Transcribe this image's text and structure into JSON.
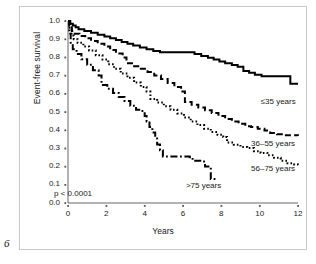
{
  "figure": {
    "number": "6"
  },
  "chart_data": {
    "type": "line",
    "title": "",
    "xlabel": "Years",
    "ylabel": "Event-free survival",
    "xlim": [
      0,
      12
    ],
    "ylim": [
      0.0,
      1.0
    ],
    "grid": false,
    "legend_position": "inline-right",
    "annotations": [
      {
        "name": "p-value",
        "text": "p < 0.0001",
        "x": 0.5,
        "y": 0.09
      }
    ],
    "xticks": [
      0,
      2,
      4,
      6,
      8,
      10,
      12
    ],
    "xtick_labels": [
      "0",
      "2",
      "4",
      "6",
      "8",
      "10",
      "12"
    ],
    "yticks": [
      0.0,
      0.1,
      0.2,
      0.3,
      0.4,
      0.5,
      0.6,
      0.7,
      0.8,
      0.9,
      1.0
    ],
    "ytick_labels": [
      "0.0",
      "0.1",
      "0.2",
      "0.3",
      "0.4",
      "0.5",
      "0.6",
      "0.7",
      "0.8",
      "0.9",
      "1.0"
    ],
    "series": [
      {
        "name": "≤35 years",
        "label": "≤35 years",
        "style": "solid",
        "color": "#000000",
        "label_x": 10.05,
        "label_y": 0.555,
        "points": [
          [
            0.0,
            1.0
          ],
          [
            0.12,
            0.985
          ],
          [
            0.25,
            0.975
          ],
          [
            0.4,
            0.965
          ],
          [
            0.55,
            0.955
          ],
          [
            0.85,
            0.945
          ],
          [
            1.2,
            0.935
          ],
          [
            1.55,
            0.925
          ],
          [
            1.9,
            0.915
          ],
          [
            2.2,
            0.905
          ],
          [
            2.5,
            0.895
          ],
          [
            2.8,
            0.885
          ],
          [
            3.1,
            0.875
          ],
          [
            3.4,
            0.865
          ],
          [
            3.75,
            0.855
          ],
          [
            4.1,
            0.845
          ],
          [
            4.45,
            0.835
          ],
          [
            4.8,
            0.828
          ],
          [
            6.3,
            0.828
          ],
          [
            6.6,
            0.818
          ],
          [
            6.95,
            0.808
          ],
          [
            7.3,
            0.798
          ],
          [
            7.6,
            0.788
          ],
          [
            7.9,
            0.778
          ],
          [
            8.2,
            0.768
          ],
          [
            8.55,
            0.758
          ],
          [
            8.85,
            0.748
          ],
          [
            9.15,
            0.725
          ],
          [
            9.45,
            0.715
          ],
          [
            9.75,
            0.705
          ],
          [
            10.1,
            0.697
          ],
          [
            11.45,
            0.697
          ],
          [
            11.6,
            0.655
          ],
          [
            12.0,
            0.655
          ]
        ]
      },
      {
        "name": "36–55 years",
        "label": "36–55 years",
        "style": "dashed",
        "color": "#000000",
        "label_x": 9.55,
        "label_y": 0.325,
        "points": [
          [
            0.0,
            1.0
          ],
          [
            0.1,
            0.965
          ],
          [
            0.2,
            0.945
          ],
          [
            0.35,
            0.93
          ],
          [
            0.6,
            0.918
          ],
          [
            0.9,
            0.905
          ],
          [
            1.2,
            0.89
          ],
          [
            1.55,
            0.875
          ],
          [
            1.9,
            0.86
          ],
          [
            2.2,
            0.84
          ],
          [
            2.5,
            0.822
          ],
          [
            2.85,
            0.8
          ],
          [
            3.05,
            0.768
          ],
          [
            3.45,
            0.752
          ],
          [
            3.8,
            0.738
          ],
          [
            4.15,
            0.72
          ],
          [
            4.5,
            0.7
          ],
          [
            4.85,
            0.682
          ],
          [
            5.2,
            0.66
          ],
          [
            5.55,
            0.638
          ],
          [
            5.9,
            0.612
          ],
          [
            6.1,
            0.555
          ],
          [
            6.45,
            0.54
          ],
          [
            6.8,
            0.525
          ],
          [
            7.15,
            0.51
          ],
          [
            7.5,
            0.495
          ],
          [
            7.85,
            0.478
          ],
          [
            8.2,
            0.462
          ],
          [
            8.55,
            0.448
          ],
          [
            8.9,
            0.435
          ],
          [
            9.25,
            0.422
          ],
          [
            9.55,
            0.418
          ],
          [
            9.9,
            0.408
          ],
          [
            10.25,
            0.398
          ],
          [
            10.55,
            0.385
          ],
          [
            10.9,
            0.378
          ],
          [
            11.3,
            0.372
          ],
          [
            12.0,
            0.37
          ]
        ]
      },
      {
        "name": "56–75 years",
        "label": "56–75 years",
        "style": "dotted",
        "color": "#000000",
        "label_x": 9.55,
        "label_y": 0.185,
        "points": [
          [
            0.0,
            1.0
          ],
          [
            0.08,
            0.955
          ],
          [
            0.18,
            0.92
          ],
          [
            0.3,
            0.9
          ],
          [
            0.5,
            0.88
          ],
          [
            0.8,
            0.86
          ],
          [
            1.1,
            0.838
          ],
          [
            1.45,
            0.812
          ],
          [
            1.8,
            0.788
          ],
          [
            2.1,
            0.762
          ],
          [
            2.4,
            0.738
          ],
          [
            2.75,
            0.712
          ],
          [
            3.1,
            0.688
          ],
          [
            3.45,
            0.662
          ],
          [
            3.8,
            0.638
          ],
          [
            4.1,
            0.612
          ],
          [
            4.3,
            0.572
          ],
          [
            4.65,
            0.552
          ],
          [
            5.0,
            0.532
          ],
          [
            5.35,
            0.512
          ],
          [
            5.7,
            0.492
          ],
          [
            6.05,
            0.47
          ],
          [
            6.4,
            0.448
          ],
          [
            6.75,
            0.428
          ],
          [
            7.1,
            0.408
          ],
          [
            7.45,
            0.39
          ],
          [
            7.8,
            0.375
          ],
          [
            8.1,
            0.362
          ],
          [
            8.3,
            0.332
          ],
          [
            8.65,
            0.32
          ],
          [
            9.0,
            0.308
          ],
          [
            9.35,
            0.302
          ],
          [
            9.7,
            0.285
          ],
          [
            10.05,
            0.275
          ],
          [
            10.4,
            0.262
          ],
          [
            10.75,
            0.248
          ],
          [
            11.1,
            0.232
          ],
          [
            11.45,
            0.218
          ],
          [
            11.8,
            0.212
          ],
          [
            12.0,
            0.21
          ]
        ]
      },
      {
        "name": ">75 years",
        "label": ">75 years",
        "style": "dashdot",
        "color": "#000000",
        "label_x": 6.15,
        "label_y": 0.095,
        "points": [
          [
            0.0,
            1.0
          ],
          [
            0.06,
            0.93
          ],
          [
            0.14,
            0.88
          ],
          [
            0.25,
            0.845
          ],
          [
            0.45,
            0.818
          ],
          [
            0.7,
            0.79
          ],
          [
            1.0,
            0.76
          ],
          [
            1.3,
            0.73
          ],
          [
            1.6,
            0.7
          ],
          [
            1.75,
            0.648
          ],
          [
            2.05,
            0.628
          ],
          [
            2.35,
            0.605
          ],
          [
            2.65,
            0.582
          ],
          [
            2.95,
            0.56
          ],
          [
            3.25,
            0.535
          ],
          [
            3.55,
            0.512
          ],
          [
            3.8,
            0.505
          ],
          [
            4.0,
            0.478
          ],
          [
            4.1,
            0.448
          ],
          [
            4.25,
            0.418
          ],
          [
            4.4,
            0.388
          ],
          [
            4.55,
            0.355
          ],
          [
            4.65,
            0.322
          ],
          [
            4.8,
            0.29
          ],
          [
            4.95,
            0.255
          ],
          [
            6.35,
            0.252
          ],
          [
            6.5,
            0.232
          ],
          [
            7.0,
            0.228
          ],
          [
            7.15,
            0.2
          ],
          [
            7.4,
            0.198
          ],
          [
            7.45,
            0.132
          ],
          [
            7.75,
            0.13
          ]
        ]
      }
    ]
  }
}
